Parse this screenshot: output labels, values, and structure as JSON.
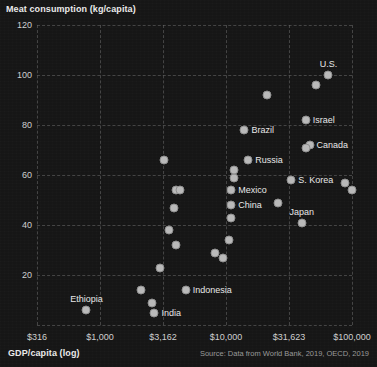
{
  "chart_data": {
    "type": "scatter",
    "title": "",
    "ylabel": "Meat consumption (kg/capita)",
    "xlabel": "GDP/capita (log)",
    "source": "Source: Data from World Bank, 2019, OECD, 2019",
    "xscale": "log",
    "xlim": [
      316,
      100000
    ],
    "ylim": [
      0,
      120
    ],
    "grid": true,
    "legend": "none",
    "yticks": [
      "120",
      "100",
      "80",
      "60",
      "40",
      "20"
    ],
    "ytick_values": [
      120,
      100,
      80,
      60,
      40,
      20
    ],
    "xticks": [
      "$316",
      "$1,000",
      "$3,162",
      "$10,000",
      "$31,623",
      "$100,000"
    ],
    "xtick_values": [
      316,
      1000,
      3162,
      10000,
      31623,
      100000
    ],
    "points": [
      {
        "label": "U.S.",
        "x": 65000,
        "y": 100,
        "label_pos": "above"
      },
      {
        "label": "",
        "x": 52000,
        "y": 96,
        "label_pos": "right"
      },
      {
        "label": "Israel",
        "x": 43000,
        "y": 82,
        "label_pos": "right"
      },
      {
        "label": "Canada",
        "x": 46000,
        "y": 72,
        "label_pos": "right"
      },
      {
        "label": "",
        "x": 43000,
        "y": 71,
        "label_pos": "right"
      },
      {
        "label": "",
        "x": 21000,
        "y": 92,
        "label_pos": "right"
      },
      {
        "label": "Brazil",
        "x": 14000,
        "y": 78,
        "label_pos": "right"
      },
      {
        "label": "Russia",
        "x": 15000,
        "y": 66,
        "label_pos": "right"
      },
      {
        "label": "",
        "x": 11500,
        "y": 59,
        "label_pos": "right"
      },
      {
        "label": "S. Korea",
        "x": 33000,
        "y": 58,
        "label_pos": "right"
      },
      {
        "label": "",
        "x": 88000,
        "y": 57,
        "label_pos": "right"
      },
      {
        "label": "",
        "x": 100000,
        "y": 54,
        "label_pos": "right"
      },
      {
        "label": "",
        "x": 26000,
        "y": 49,
        "label_pos": "right"
      },
      {
        "label": "Mexico",
        "x": 11000,
        "y": 54,
        "label_pos": "right"
      },
      {
        "label": "China",
        "x": 11000,
        "y": 48,
        "label_pos": "right"
      },
      {
        "label": "",
        "x": 11000,
        "y": 43,
        "label_pos": "right"
      },
      {
        "label": "",
        "x": 11500,
        "y": 62,
        "label_pos": "right"
      },
      {
        "label": "",
        "x": 4000,
        "y": 54,
        "label_pos": "right"
      },
      {
        "label": "",
        "x": 4300,
        "y": 54,
        "label_pos": "right"
      },
      {
        "label": "",
        "x": 3900,
        "y": 47,
        "label_pos": "right"
      },
      {
        "label": "",
        "x": 3200,
        "y": 66,
        "label_pos": "right"
      },
      {
        "label": "Japan",
        "x": 40000,
        "y": 41,
        "label_pos": "above"
      },
      {
        "label": "",
        "x": 3500,
        "y": 38,
        "label_pos": "right"
      },
      {
        "label": "",
        "x": 4000,
        "y": 32,
        "label_pos": "right"
      },
      {
        "label": "",
        "x": 8200,
        "y": 29,
        "label_pos": "right"
      },
      {
        "label": "",
        "x": 9500,
        "y": 27,
        "label_pos": "right"
      },
      {
        "label": "",
        "x": 10500,
        "y": 34,
        "label_pos": "right"
      },
      {
        "label": "",
        "x": 3000,
        "y": 23,
        "label_pos": "right"
      },
      {
        "label": "Indonesia",
        "x": 4800,
        "y": 14,
        "label_pos": "right"
      },
      {
        "label": "",
        "x": 2100,
        "y": 14,
        "label_pos": "right"
      },
      {
        "label": "India",
        "x": 2700,
        "y": 5,
        "label_pos": "right"
      },
      {
        "label": "",
        "x": 2600,
        "y": 9,
        "label_pos": "right"
      },
      {
        "label": "Ethiopia",
        "x": 780,
        "y": 6,
        "label_pos": "above"
      }
    ]
  },
  "colors": {
    "background": "#161616",
    "grid": "#6a6a6a",
    "point": "#b9b9b9",
    "text": "#e8e8e8",
    "muted": "#9a9a9a"
  }
}
